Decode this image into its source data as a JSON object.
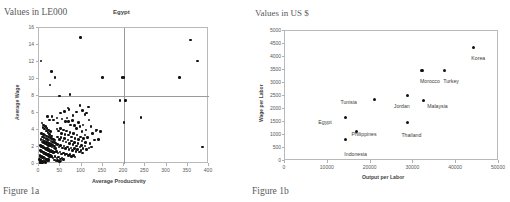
{
  "figure_a": {
    "units_label": "Values in LE000",
    "caption": "Figure 1a"
  },
  "figure_b": {
    "units_label": "Values in US $",
    "caption": "Figure 1b"
  },
  "chart_data": [
    {
      "type": "scatter",
      "title": "Egypt",
      "xlabel": "Average Productivity",
      "ylabel": "Average Wage",
      "xlim": [
        0,
        400
      ],
      "ylim": [
        0,
        16
      ],
      "xticks": [
        0,
        50,
        100,
        150,
        200,
        250,
        300,
        350,
        400
      ],
      "xtick_labels": [
        "0",
        "50",
        "100",
        "150",
        "200",
        "250",
        "300",
        "350",
        "400"
      ],
      "yticks": [
        0,
        2,
        4,
        6,
        8,
        10,
        12,
        14,
        16
      ],
      "ytick_labels": [
        "0",
        "2",
        "4",
        "6",
        "8",
        "10",
        "12",
        "14",
        "16"
      ],
      "grid": false,
      "legend": "none",
      "reference_lines": {
        "horizontal_y": 8,
        "vertical_x": 200
      },
      "points": [
        [
          5,
          12.1
        ],
        [
          30,
          10.9
        ],
        [
          26,
          9.3
        ],
        [
          38,
          10.2
        ],
        [
          48,
          8.0
        ],
        [
          98,
          14.9
        ],
        [
          73,
          8.2
        ],
        [
          68,
          6.6
        ],
        [
          71,
          6.4
        ],
        [
          150,
          10.2
        ],
        [
          196,
          10.2
        ],
        [
          200,
          10.2
        ],
        [
          330,
          10.2
        ],
        [
          373,
          12.1
        ],
        [
          356,
          14.6
        ],
        [
          191,
          7.5
        ],
        [
          203,
          7.5
        ],
        [
          200,
          4.9
        ],
        [
          240,
          5.5
        ],
        [
          385,
          2.0
        ],
        [
          135,
          4.0
        ],
        [
          145,
          3.8
        ],
        [
          123,
          2.0
        ],
        [
          20,
          5.6
        ],
        [
          25,
          5.2
        ],
        [
          31,
          5.6
        ],
        [
          34,
          5.2
        ],
        [
          42,
          5.4
        ],
        [
          44,
          4.8
        ],
        [
          50,
          6.0
        ],
        [
          54,
          5.3
        ],
        [
          60,
          6.2
        ],
        [
          62,
          5.0
        ],
        [
          66,
          5.4
        ],
        [
          70,
          5.0
        ],
        [
          74,
          4.6
        ],
        [
          79,
          5.1
        ],
        [
          84,
          4.5
        ],
        [
          88,
          4.2
        ],
        [
          93,
          4.9
        ],
        [
          96,
          4.4
        ],
        [
          101,
          3.8
        ],
        [
          104,
          4.6
        ],
        [
          108,
          3.4
        ],
        [
          111,
          4.0
        ],
        [
          114,
          3.1
        ],
        [
          7,
          4.8
        ],
        [
          9,
          4.3
        ],
        [
          11,
          4.6
        ],
        [
          13,
          4.1
        ],
        [
          15,
          4.4
        ],
        [
          17,
          3.9
        ],
        [
          19,
          4.2
        ],
        [
          21,
          3.7
        ],
        [
          23,
          4.0
        ],
        [
          25,
          3.5
        ],
        [
          27,
          3.8
        ],
        [
          29,
          3.3
        ],
        [
          6,
          3.6
        ],
        [
          8,
          3.2
        ],
        [
          10,
          3.5
        ],
        [
          12,
          3.1
        ],
        [
          14,
          3.4
        ],
        [
          16,
          3.0
        ],
        [
          18,
          3.3
        ],
        [
          20,
          2.9
        ],
        [
          22,
          3.2
        ],
        [
          24,
          2.8
        ],
        [
          26,
          3.1
        ],
        [
          28,
          2.7
        ],
        [
          30,
          3.0
        ],
        [
          32,
          2.6
        ],
        [
          34,
          2.9
        ],
        [
          36,
          2.5
        ],
        [
          38,
          2.8
        ],
        [
          40,
          2.4
        ],
        [
          5,
          2.9
        ],
        [
          7,
          2.6
        ],
        [
          9,
          2.8
        ],
        [
          11,
          2.5
        ],
        [
          13,
          2.7
        ],
        [
          15,
          2.4
        ],
        [
          17,
          2.6
        ],
        [
          19,
          2.3
        ],
        [
          21,
          2.5
        ],
        [
          23,
          2.2
        ],
        [
          25,
          2.4
        ],
        [
          27,
          2.1
        ],
        [
          29,
          2.3
        ],
        [
          31,
          2.0
        ],
        [
          33,
          2.2
        ],
        [
          35,
          1.9
        ],
        [
          37,
          2.1
        ],
        [
          39,
          1.8
        ],
        [
          4,
          2.2
        ],
        [
          6,
          2.0
        ],
        [
          8,
          2.1
        ],
        [
          10,
          1.9
        ],
        [
          12,
          2.0
        ],
        [
          14,
          1.8
        ],
        [
          16,
          1.9
        ],
        [
          18,
          1.7
        ],
        [
          20,
          1.8
        ],
        [
          22,
          1.6
        ],
        [
          24,
          1.7
        ],
        [
          26,
          1.5
        ],
        [
          28,
          1.6
        ],
        [
          30,
          1.4
        ],
        [
          32,
          1.5
        ],
        [
          34,
          1.3
        ],
        [
          36,
          1.4
        ],
        [
          3,
          1.6
        ],
        [
          5,
          1.4
        ],
        [
          7,
          1.5
        ],
        [
          9,
          1.3
        ],
        [
          11,
          1.4
        ],
        [
          13,
          1.2
        ],
        [
          15,
          1.3
        ],
        [
          17,
          1.1
        ],
        [
          19,
          1.2
        ],
        [
          21,
          1.0
        ],
        [
          23,
          1.1
        ],
        [
          25,
          0.9
        ],
        [
          27,
          1.0
        ],
        [
          29,
          0.8
        ],
        [
          31,
          0.9
        ],
        [
          33,
          0.7
        ],
        [
          2,
          1.0
        ],
        [
          4,
          0.8
        ],
        [
          6,
          0.9
        ],
        [
          8,
          0.7
        ],
        [
          10,
          0.8
        ],
        [
          12,
          0.6
        ],
        [
          14,
          0.7
        ],
        [
          16,
          0.5
        ],
        [
          18,
          0.6
        ],
        [
          20,
          0.4
        ],
        [
          22,
          0.5
        ],
        [
          24,
          0.35
        ],
        [
          1,
          0.5
        ],
        [
          3,
          0.4
        ],
        [
          5,
          0.45
        ],
        [
          7,
          0.3
        ],
        [
          9,
          0.35
        ],
        [
          11,
          0.25
        ],
        [
          13,
          0.3
        ],
        [
          15,
          0.2
        ],
        [
          2,
          0.15
        ],
        [
          4,
          0.2
        ],
        [
          6,
          0.1
        ],
        [
          8,
          0.12
        ],
        [
          42,
          4.1
        ],
        [
          46,
          3.9
        ],
        [
          50,
          4.2
        ],
        [
          53,
          3.6
        ],
        [
          57,
          4.0
        ],
        [
          61,
          3.5
        ],
        [
          65,
          3.9
        ],
        [
          69,
          3.4
        ],
        [
          73,
          3.7
        ],
        [
          77,
          3.2
        ],
        [
          81,
          3.6
        ],
        [
          85,
          3.0
        ],
        [
          89,
          3.4
        ],
        [
          93,
          2.9
        ],
        [
          97,
          3.2
        ],
        [
          101,
          2.7
        ],
        [
          105,
          3.0
        ],
        [
          109,
          2.5
        ],
        [
          44,
          3.2
        ],
        [
          48,
          2.9
        ],
        [
          52,
          3.1
        ],
        [
          56,
          2.7
        ],
        [
          60,
          3.0
        ],
        [
          64,
          2.6
        ],
        [
          68,
          2.8
        ],
        [
          72,
          2.4
        ],
        [
          76,
          2.7
        ],
        [
          80,
          2.3
        ],
        [
          84,
          2.5
        ],
        [
          88,
          2.1
        ],
        [
          92,
          2.4
        ],
        [
          96,
          2.0
        ],
        [
          100,
          2.2
        ],
        [
          104,
          1.8
        ],
        [
          108,
          2.1
        ],
        [
          112,
          1.7
        ],
        [
          43,
          2.3
        ],
        [
          47,
          2.0
        ],
        [
          51,
          2.2
        ],
        [
          55,
          1.9
        ],
        [
          59,
          2.1
        ],
        [
          63,
          1.8
        ],
        [
          67,
          2.0
        ],
        [
          71,
          1.7
        ],
        [
          75,
          1.9
        ],
        [
          79,
          1.6
        ],
        [
          83,
          1.8
        ],
        [
          87,
          1.5
        ],
        [
          91,
          1.7
        ],
        [
          95,
          1.4
        ],
        [
          99,
          1.6
        ],
        [
          103,
          1.3
        ],
        [
          41,
          1.5
        ],
        [
          45,
          1.3
        ],
        [
          49,
          1.4
        ],
        [
          53,
          1.2
        ],
        [
          57,
          1.3
        ],
        [
          61,
          1.1
        ],
        [
          65,
          1.2
        ],
        [
          69,
          1.0
        ],
        [
          73,
          1.1
        ],
        [
          77,
          0.9
        ],
        [
          81,
          1.0
        ],
        [
          85,
          0.8
        ],
        [
          38,
          0.9
        ],
        [
          42,
          0.7
        ],
        [
          46,
          0.8
        ],
        [
          50,
          0.6
        ],
        [
          54,
          0.7
        ],
        [
          58,
          0.5
        ],
        [
          36,
          0.45
        ],
        [
          40,
          0.35
        ],
        [
          44,
          0.4
        ],
        [
          48,
          0.3
        ],
        [
          52,
          0.35
        ],
        [
          118,
          5.2
        ],
        [
          122,
          4.4
        ],
        [
          126,
          3.6
        ],
        [
          130,
          2.8
        ],
        [
          118,
          1.9
        ],
        [
          112,
          6.0
        ],
        [
          116,
          6.7
        ],
        [
          108,
          5.8
        ],
        [
          102,
          6.3
        ],
        [
          96,
          6.9
        ],
        [
          88,
          6.1
        ],
        [
          80,
          5.7
        ],
        [
          120,
          2.4
        ],
        [
          134,
          3.9
        ],
        [
          140,
          2.9
        ]
      ]
    },
    {
      "type": "scatter",
      "title": "",
      "xlabel": "Output per Labor",
      "ylabel": "Wage per Labor",
      "xlim": [
        0,
        50000
      ],
      "ylim": [
        0,
        5000
      ],
      "xticks": [
        0,
        10000,
        20000,
        30000,
        40000,
        50000
      ],
      "xtick_labels": [
        "0",
        "10000",
        "20000",
        "30000",
        "40000",
        "50000"
      ],
      "yticks": [
        0,
        500,
        1000,
        1500,
        2000,
        2500,
        3000,
        3500,
        4000,
        4500,
        5000
      ],
      "ytick_labels": [
        "0",
        "500",
        "1000",
        "1500",
        "2000",
        "2500",
        "3000",
        "3500",
        "4000",
        "4500",
        "5000"
      ],
      "grid": false,
      "legend": "none",
      "labeled_points": [
        {
          "name": "Korea",
          "x": 44000,
          "y": 4350,
          "label_dx": -2,
          "label_dy": 7
        },
        {
          "name": "Turkey",
          "x": 37200,
          "y": 3490,
          "label_dx": -1,
          "label_dy": 8
        },
        {
          "name": "Morocco",
          "x": 32000,
          "y": 3490,
          "label_dx": -2,
          "label_dy": 8
        },
        {
          "name": "Malaysia",
          "x": 32300,
          "y": 2320,
          "label_dx": 4,
          "label_dy": 2
        },
        {
          "name": "Jordan",
          "x": 28700,
          "y": 2530,
          "label_dx": -14,
          "label_dy": 8
        },
        {
          "name": "Tunisia",
          "x": 20900,
          "y": 2370,
          "label_dx": -34,
          "label_dy": 0
        },
        {
          "name": "Thailand",
          "x": 28600,
          "y": 1480,
          "label_dx": -6,
          "label_dy": 9
        },
        {
          "name": "Egypt",
          "x": 14100,
          "y": 1670,
          "label_dx": -27,
          "label_dy": 1
        },
        {
          "name": "Philippines",
          "x": 16700,
          "y": 1120,
          "label_dx": -5,
          "label_dy": -1
        },
        {
          "name": "Indonesia",
          "x": 14100,
          "y": 820,
          "label_dx": -1,
          "label_dy": 11
        }
      ]
    }
  ]
}
